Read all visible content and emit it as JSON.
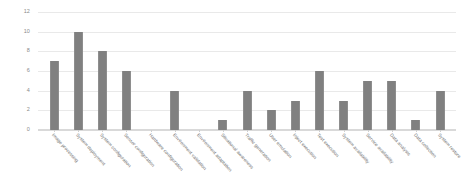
{
  "chart_data": {
    "type": "bar",
    "title": "",
    "subtitle": "",
    "xlabel": "",
    "ylabel": "",
    "ylim": [
      0,
      12
    ],
    "ytick_step": 2,
    "yticks": [
      "0",
      "2",
      "4",
      "6",
      "8",
      "10",
      "12"
    ],
    "grid": true,
    "legend": false,
    "bar_color": "#808080",
    "grid_color": "#e9e9e9",
    "axis_color": "#d9d9d9",
    "label_color": "#6b6b6b",
    "categories": [
      "Image processing",
      "System deployment",
      "System configuration",
      "Sensor configuration",
      "Hardware configuration",
      "Environment validation",
      "Environment adaptation",
      "Situational awareness",
      "Traffic generation",
      "User emulation",
      "Inject execution",
      "Test execution",
      "System availability",
      "Service availability",
      "Data analysis",
      "Data collection",
      "System restore"
    ],
    "values": [
      7,
      10,
      8,
      6,
      0,
      4,
      0,
      1,
      4,
      2,
      3,
      6,
      3,
      5,
      5,
      1,
      4
    ]
  }
}
